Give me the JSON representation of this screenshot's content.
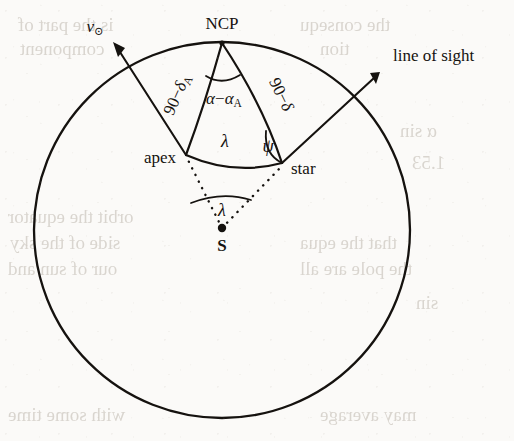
{
  "figure": {
    "kind": "celestial-sphere-spherical-triangle-diagram",
    "background_color": "#fbfaf8",
    "ink_color": "#15120f"
  },
  "labels": {
    "ncp": "NCP",
    "apex": "apex",
    "star": "star",
    "sun_center": "S",
    "solar_velocity": "v",
    "solar_velocity_sub": "⊙",
    "line_of_sight": "line of sight",
    "side_ncp_apex_num": "90",
    "side_ncp_apex_minus": "−",
    "side_ncp_apex_delta": "δ",
    "side_ncp_apex_sub": "A",
    "side_ncp_star_num": "90",
    "side_ncp_star_minus": "−",
    "side_ncp_star_delta": "δ",
    "angle_at_ncp_alpha": "α",
    "angle_at_ncp_minus": "−",
    "angle_at_ncp_alpha2": "α",
    "angle_at_ncp_sub": "A",
    "side_apex_star": "λ",
    "angle_at_star": "ψ",
    "angle_at_center": "λ"
  },
  "geometry": {
    "sphere": {
      "cx": 222,
      "cy": 230,
      "r": 188
    },
    "points": {
      "ncp": {
        "x": 222,
        "y": 43
      },
      "apex": {
        "x": 186,
        "y": 155
      },
      "star": {
        "x": 282,
        "y": 163
      },
      "center_s": {
        "x": 222,
        "y": 228
      }
    },
    "vectors": {
      "solar_velocity_tip": {
        "x": 113,
        "y": 42
      },
      "line_of_sight_tip": {
        "x": 380,
        "y": 72
      }
    }
  },
  "bleed_text": [
    {
      "text": "is the part of",
      "x": 18,
      "y": 14
    },
    {
      "text": "the consequ",
      "x": 300,
      "y": 14
    },
    {
      "text": "component",
      "x": 20,
      "y": 38
    },
    {
      "text": "tion",
      "x": 320,
      "y": 38
    },
    {
      "text": "α sin",
      "x": 400,
      "y": 120
    },
    {
      "text": "1.53",
      "x": 412,
      "y": 152
    },
    {
      "text": "orbit the equator",
      "x": 8,
      "y": 206
    },
    {
      "text": "side of the sky",
      "x": 10,
      "y": 232
    },
    {
      "text": "that the equa",
      "x": 300,
      "y": 232
    },
    {
      "text": "our of sun and",
      "x": 8,
      "y": 258
    },
    {
      "text": "the pole are all",
      "x": 300,
      "y": 258
    },
    {
      "text": "sin",
      "x": 416,
      "y": 292
    },
    {
      "text": "with some time",
      "x": 8,
      "y": 404
    },
    {
      "text": "may average",
      "x": 320,
      "y": 404
    }
  ]
}
